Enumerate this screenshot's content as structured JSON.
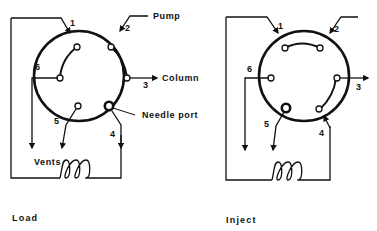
{
  "diagram": {
    "type": "six-port injection valve schematic",
    "stroke_color": "#111111",
    "background": "#ffffff",
    "panels": [
      {
        "id": "load",
        "caption": "Load",
        "port_numbers": [
          "1",
          "2",
          "3",
          "4",
          "5",
          "6"
        ],
        "labels": {
          "pump": "Pump",
          "column": "Column",
          "needle_port": "Needle port",
          "vents": "Vents"
        },
        "connections": [
          "1-6",
          "2-3",
          "4 needle port to loop"
        ]
      },
      {
        "id": "inject",
        "caption": "Inject",
        "port_numbers": [
          "1",
          "2",
          "3",
          "4",
          "5",
          "6"
        ],
        "connections": [
          "1-2",
          "3-4"
        ]
      }
    ]
  }
}
